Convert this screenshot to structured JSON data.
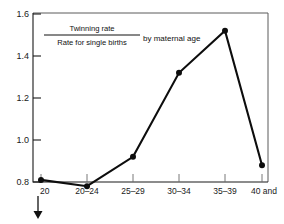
{
  "chart_data": {
    "type": "line",
    "title_parts": {
      "numerator": "Twinning rate",
      "denominator": "Rate for single births",
      "suffix": "by maternal age"
    },
    "categories": [
      "20",
      "20–24",
      "25–29",
      "30–34",
      "35–39",
      "40 and"
    ],
    "values": [
      0.81,
      0.78,
      0.92,
      1.32,
      1.52,
      0.88
    ],
    "xlabel": "",
    "ylabel": "",
    "ylim": [
      0.8,
      1.6
    ],
    "yticks": [
      "0.8",
      "1.0",
      "1.2",
      "1.4",
      "1.6"
    ],
    "ytick_values": [
      0.8,
      1.0,
      1.2,
      1.4,
      1.6
    ],
    "grid": false,
    "legend": "none",
    "marker": "filled-circle",
    "annotations": [
      {
        "name": "under-20-arrow",
        "symbol": "downward-arrow",
        "near_category": "20"
      }
    ],
    "colors": {
      "line": "#0d0d0d",
      "marker": "#0d0d0d",
      "axis": "#1a1a1a",
      "frame": "#5a5a5a",
      "text": "#111111",
      "background": "#ffffff"
    }
  }
}
